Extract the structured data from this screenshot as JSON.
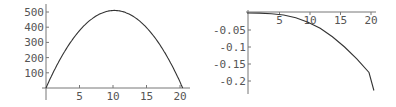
{
  "chart_data": [
    {
      "type": "line",
      "title": "",
      "xlabel": "",
      "ylabel": "",
      "xlim": [
        0,
        21
      ],
      "ylim": [
        0,
        520
      ],
      "grid": false,
      "x_ticks": [
        "5",
        "10",
        "15",
        "20"
      ],
      "y_ticks": [
        "100",
        "200",
        "300",
        "400",
        "500"
      ],
      "series": [
        {
          "name": "curve",
          "x": [
            0,
            2,
            4,
            6,
            8,
            10,
            10.2,
            12,
            14,
            16,
            18,
            20,
            20.4
          ],
          "y": [
            0,
            180,
            322,
            424,
            486,
            510,
            510,
            494,
            440,
            346,
            212,
            40,
            0
          ]
        }
      ],
      "pixel": {
        "x0": 46,
        "y0": 88,
        "px_per_x": 6.7,
        "px_per_y": 0.152
      }
    },
    {
      "type": "line",
      "title": "",
      "xlabel": "",
      "ylabel": "",
      "xlim": [
        0,
        21
      ],
      "ylim": [
        -0.23,
        0
      ],
      "grid": false,
      "x_ticks": [
        "5",
        "10",
        "15",
        "20"
      ],
      "y_ticks": [
        "-0.05",
        "-0.1",
        "-0.15",
        "-0.2"
      ],
      "series": [
        {
          "name": "curve",
          "x": [
            0,
            2,
            4,
            6,
            8,
            10,
            12,
            14,
            16,
            18,
            20,
            20.8
          ],
          "y": [
            0,
            -0.0003,
            -0.002,
            -0.006,
            -0.014,
            -0.027,
            -0.045,
            -0.07,
            -0.1,
            -0.135,
            -0.175,
            -0.228
          ]
        }
      ],
      "pixel": {
        "x0": 247,
        "y0": 13,
        "px_per_x": 6.1,
        "px_per_y": 340
      }
    }
  ]
}
